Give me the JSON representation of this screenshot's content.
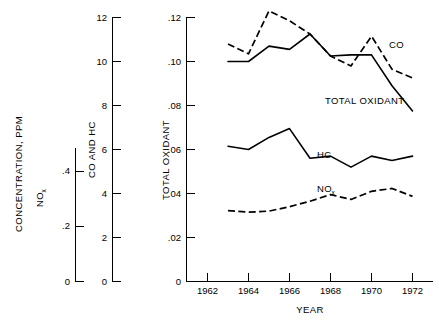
{
  "chart_data": {
    "type": "line",
    "title": "",
    "xlabel": "YEAR",
    "x": [
      1963,
      1964,
      1965,
      1966,
      1967,
      1968,
      1969,
      1970,
      1971,
      1972
    ],
    "xlim": [
      1961.3,
      1972.6
    ],
    "xticks": [
      1962,
      1964,
      1966,
      1968,
      1970,
      1972
    ],
    "xticklabels": [
      "1962",
      "1964",
      "1966",
      "1968",
      "1970",
      "1972"
    ],
    "grid": false,
    "legend_position": "inline-annotations",
    "series": [
      {
        "name": "CO",
        "axis": "co-and-hc",
        "style": "dashed",
        "values_axis_total_oxidant": [
          0.108,
          0.1035,
          0.123,
          0.1185,
          0.1125,
          0.1025,
          0.098,
          0.1115,
          0.0965,
          0.0925
        ],
        "values": [
          10.8,
          10.35,
          12.3,
          11.85,
          11.25,
          10.25,
          9.8,
          11.15,
          9.65,
          9.25
        ]
      },
      {
        "name": "TOTAL OXIDANT",
        "axis": "total-oxidant",
        "style": "solid",
        "values": [
          0.1,
          0.1,
          0.107,
          0.1055,
          0.1125,
          0.1025,
          0.103,
          0.103,
          0.089,
          0.0775
        ]
      },
      {
        "name": "HC",
        "axis": "co-and-hc",
        "style": "solid",
        "values_axis_total_oxidant": [
          0.0615,
          0.06,
          0.0655,
          0.0695,
          0.056,
          0.057,
          0.052,
          0.057,
          0.055,
          0.057
        ],
        "values": [
          6.15,
          6.0,
          6.55,
          6.95,
          5.6,
          5.7,
          5.2,
          5.7,
          5.5,
          5.7
        ]
      },
      {
        "name": "NOx",
        "axis": "nox",
        "style": "dashed",
        "values_axis_total_oxidant": [
          0.0322,
          0.0315,
          0.032,
          0.034,
          0.0365,
          0.0395,
          0.0373,
          0.041,
          0.0423,
          0.0387
        ],
        "values": [
          0.161,
          0.158,
          0.16,
          0.17,
          0.183,
          0.198,
          0.187,
          0.205,
          0.212,
          0.194
        ]
      }
    ],
    "axes": [
      {
        "id": "nox",
        "outer_title": "CONCENTRATION, PPM",
        "title": "NOx",
        "ticks": [
          0,
          0.2,
          0.4
        ],
        "ticklabels": [
          "0",
          ".2",
          ".4"
        ],
        "ylim": [
          0,
          0.5
        ]
      },
      {
        "id": "co-and-hc",
        "title": "CO AND HC",
        "ticks": [
          0,
          2,
          4,
          6,
          8,
          10,
          12
        ],
        "ticklabels": [
          "0",
          "2",
          "4",
          "6",
          "8",
          "10",
          "12"
        ],
        "ylim": [
          0,
          12
        ]
      },
      {
        "id": "total-oxidant",
        "title": "TOTAL OXIDANT",
        "ticks": [
          0,
          0.02,
          0.04,
          0.06,
          0.08,
          0.1,
          0.12
        ],
        "ticklabels": [
          "0",
          ".02",
          ".04",
          ".06",
          ".08",
          ".10",
          ".12"
        ],
        "ylim": [
          0,
          0.12
        ]
      }
    ],
    "annotations": [
      {
        "text": "CO",
        "x": 389,
        "y": 48
      },
      {
        "text": "TOTAL OXIDANT",
        "x": 325,
        "y": 104
      },
      {
        "text": "HC",
        "x": 317,
        "y": 158
      },
      {
        "text": "NOx",
        "x": 317,
        "y": 192
      }
    ]
  },
  "labels": {
    "concentration_ppm": "CONCENTRATION, PPM",
    "nox_main": "NO",
    "nox_sub": "x",
    "co_and_hc": "CO AND HC",
    "total_oxidant": "TOTAL OXIDANT",
    "year": "YEAR",
    "co": "CO",
    "hc": "HC"
  },
  "ticks": {
    "nox": [
      "0",
      ".2",
      ".4"
    ],
    "cohc": [
      "0",
      "2",
      "4",
      "6",
      "8",
      "10",
      "12"
    ],
    "oxidant": [
      "0",
      ".02",
      ".04",
      ".06",
      ".08",
      ".10",
      ".12"
    ],
    "years": [
      "1962",
      "1964",
      "1966",
      "1968",
      "1970",
      "1972"
    ]
  },
  "colors": {
    "ink": "#000000",
    "background": "#ffffff"
  }
}
